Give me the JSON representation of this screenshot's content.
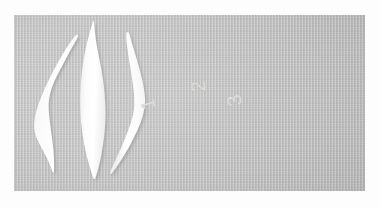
{
  "image": {
    "kind": "photograph",
    "subject": "three white crescent-shaped specimens arranged vertically on gray woven fabric",
    "width": 380,
    "height": 207,
    "background_color": "#ffffff",
    "plate_color": "#c3c3c3",
    "specimen_color": "#fefefe"
  },
  "plate": {
    "name": "gray fabric backdrop",
    "left": 14,
    "top": 15,
    "width": 351,
    "height": 176
  },
  "specimens": [
    {
      "label": "1",
      "shape": "curved crescent, concave toward the right, broad upper-left body tapering to a thin point at top and a narrow tail at bottom",
      "orientation": "vertical, tips up and down",
      "label_rotation_deg": -104
    },
    {
      "label": "2",
      "shape": "symmetric lens / leaf shape, pointed at both ends, widest at mid-height",
      "orientation": "vertical, tips up and down",
      "label_rotation_deg": -96
    },
    {
      "label": "3",
      "shape": "curved crescent mirroring specimen 1, concave toward the left, thin hooked point at top and tapering tail at lower left",
      "orientation": "vertical, tips up and down",
      "label_rotation_deg": -102
    }
  ]
}
